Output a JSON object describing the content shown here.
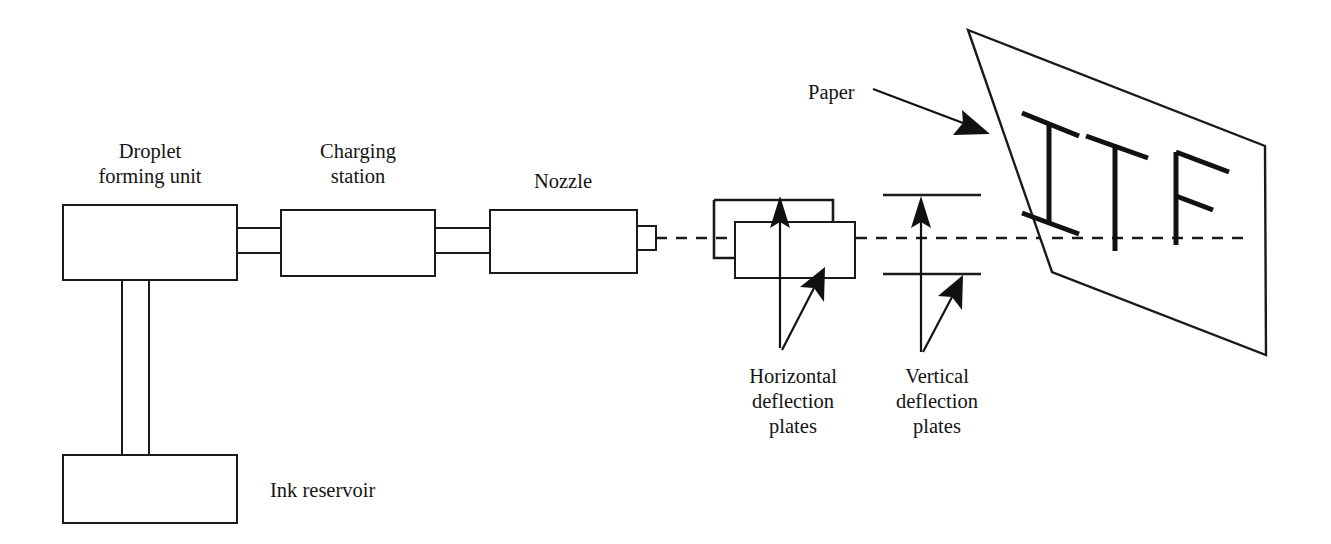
{
  "diagram": {
    "background_color": "#ffffff",
    "line_color": "#1a1a1a",
    "labels": {
      "droplet_unit_line1": "Droplet",
      "droplet_unit_line2": "forming unit",
      "charging_line1": "Charging",
      "charging_line2": "station",
      "nozzle": "Nozzle",
      "ink_reservoir": "Ink reservoir",
      "paper": "Paper",
      "horizontal_plates_line1": "Horizontal",
      "horizontal_plates_line2": "deflection",
      "horizontal_plates_line3": "plates",
      "vertical_plates_line1": "Vertical",
      "vertical_plates_line2": "deflection",
      "vertical_plates_line3": "plates"
    },
    "printed_text_on_paper": "ITF",
    "components": [
      {
        "name": "droplet-forming-unit",
        "shape": "rectangle"
      },
      {
        "name": "charging-station",
        "shape": "rectangle"
      },
      {
        "name": "nozzle",
        "shape": "rectangle"
      },
      {
        "name": "ink-reservoir",
        "shape": "rectangle"
      },
      {
        "name": "horizontal-deflection-plates",
        "shape": "offset-rectangles"
      },
      {
        "name": "vertical-deflection-plates",
        "shape": "parallel-lines"
      },
      {
        "name": "paper",
        "shape": "perspective-quadrilateral"
      },
      {
        "name": "ink-droplet-beam",
        "shape": "dashed-line"
      }
    ]
  }
}
